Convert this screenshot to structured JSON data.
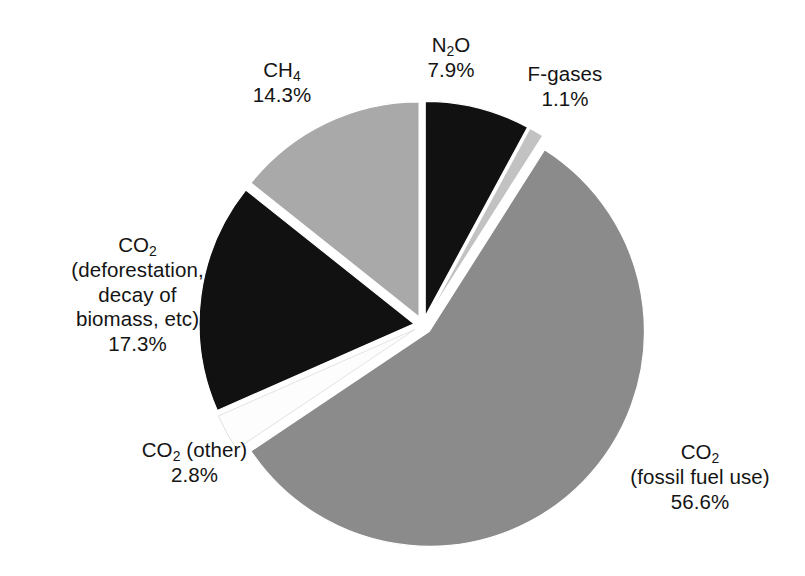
{
  "chart_data": {
    "type": "pie",
    "title": "",
    "subtitle": "",
    "xlabel": "",
    "ylabel": "",
    "legend_position": "none",
    "grid": false,
    "exploded": true,
    "start_angle_deg": 0,
    "direction": "clockwise",
    "categories": [
      "N2O",
      "F-gases",
      "CO2 (fossil fuel use)",
      "CO2 (other)",
      "CO2 (deforestation, decay of biomass, etc)",
      "CH4"
    ],
    "values": [
      7.9,
      1.1,
      56.6,
      2.8,
      17.3,
      14.3
    ],
    "value_unit": "%",
    "colors": [
      "#111111",
      "#c2c2c2",
      "#8b8b8b",
      "#fdfdfd",
      "#111111",
      "#a9a9a9"
    ],
    "slices": [
      {
        "id": "n2o",
        "name": "N2O",
        "value": 7.9,
        "value_text": "7.9%",
        "color": "#111111",
        "label_lines": [
          "N2O",
          "7.9%"
        ]
      },
      {
        "id": "f-gases",
        "name": "F-gases",
        "value": 1.1,
        "value_text": "1.1%",
        "color": "#c2c2c2",
        "label_lines": [
          "F-gases",
          "1.1%"
        ]
      },
      {
        "id": "co2-fossil-fuel",
        "name": "CO2 (fossil fuel use)",
        "value": 56.6,
        "value_text": "56.6%",
        "color": "#8b8b8b",
        "label_lines": [
          "CO2",
          "(fossil fuel use)",
          "56.6%"
        ]
      },
      {
        "id": "co2-other",
        "name": "CO2 (other)",
        "value": 2.8,
        "value_text": "2.8%",
        "color": "#fdfdfd",
        "label_lines": [
          "CO2 (other)",
          "2.8%"
        ]
      },
      {
        "id": "co2-deforestation",
        "name": "CO2 (deforestation, decay of biomass, etc)",
        "value": 17.3,
        "value_text": "17.3%",
        "color": "#111111",
        "label_lines": [
          "CO2",
          "(deforestation,",
          "decay of",
          "biomass, etc)",
          "17.3%"
        ]
      },
      {
        "id": "ch4",
        "name": "CH4",
        "value": 14.3,
        "value_text": "14.3%",
        "color": "#a9a9a9",
        "label_lines": [
          "CH4",
          "14.3%"
        ]
      }
    ]
  },
  "labels": {
    "n2o": {
      "name": "N",
      "sub": "2",
      "name_tail": "O",
      "pct": "7.9%"
    },
    "fgases": {
      "name": "F-gases",
      "pct": "1.1%"
    },
    "ch4": {
      "name": "CH",
      "sub": "4",
      "name_tail": "",
      "pct": "14.3%"
    },
    "co2_deforestation": {
      "name": "CO",
      "sub": "2",
      "name_tail": "",
      "line2": "(deforestation,",
      "line3": "decay of",
      "line4": "biomass, etc)",
      "pct": "17.3%"
    },
    "co2_other": {
      "name": "CO",
      "sub": "2",
      "name_tail": " (other)",
      "pct": "2.8%"
    },
    "co2_fossil": {
      "name": "CO",
      "sub": "2",
      "name_tail": "",
      "line2": "(fossil fuel use)",
      "pct": "56.6%"
    }
  },
  "geometry": {
    "center_x": 423,
    "center_y": 325,
    "radius": 215
  }
}
